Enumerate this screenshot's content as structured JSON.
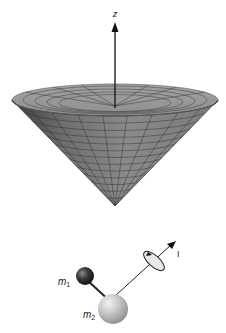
{
  "figure": {
    "cone_panel": {
      "axis_label": "z",
      "description": "Cone of possible angular momentum orientations about the z axis"
    },
    "molecule_panel": {
      "mass1_label": "m",
      "mass1_subscript": "1",
      "mass2_label": "m",
      "mass2_subscript": "2",
      "angular_momentum_label": "I"
    },
    "colors": {
      "cone_surface": "#8c8c8c",
      "cone_inner": "#9a9a9a",
      "cone_grid": "#3a3a3a",
      "mass1": "#2b2b2b",
      "mass2": "#b8b8b8",
      "axis": "#111111"
    }
  }
}
